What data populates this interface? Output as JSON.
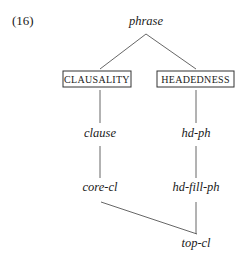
{
  "example_number": "(16)",
  "root": "phrase",
  "dimensions": [
    {
      "id": "clausality",
      "label": "CLAUSALITY"
    },
    {
      "id": "headedness",
      "label": "HEADEDNESS"
    }
  ],
  "nodes": {
    "clause": "clause",
    "hd_ph": "hd-ph",
    "core_cl": "core-cl",
    "hd_fill_ph": "hd-fill-ph",
    "top_cl": "top-cl"
  },
  "edges": [
    [
      "phrase",
      "CLAUSALITY"
    ],
    [
      "phrase",
      "HEADEDNESS"
    ],
    [
      "CLAUSALITY",
      "clause"
    ],
    [
      "HEADEDNESS",
      "hd-ph"
    ],
    [
      "clause",
      "core-cl"
    ],
    [
      "hd-ph",
      "hd-fill-ph"
    ],
    [
      "core-cl",
      "top-cl"
    ],
    [
      "hd-fill-ph",
      "top-cl"
    ]
  ]
}
